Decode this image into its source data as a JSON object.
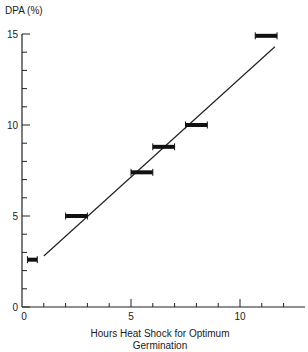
{
  "chart_data": {
    "type": "scatter",
    "title": "",
    "xlabel": "Hours Heat Shock for Optimum Germination",
    "xlabel_line1": "Hours Heat Shock for Optimum",
    "xlabel_line2": "Germination",
    "ylabel": "DPA (%)",
    "xlim": [
      0,
      12.5
    ],
    "ylim": [
      0,
      15
    ],
    "x_ticks": [
      0,
      5,
      10
    ],
    "x_tick_labels": [
      "0",
      "5",
      "10"
    ],
    "x_minor_tick_step": 1,
    "y_ticks": [
      0,
      5,
      10,
      15
    ],
    "y_tick_labels": [
      "0",
      "5",
      "10",
      "15"
    ],
    "y_minor_tick_step": 1,
    "grid": false,
    "legend": null,
    "series": [
      {
        "name": "Observed (horizontal range bars)",
        "marker": "horizontal-bar",
        "points": [
          {
            "x_min": 0.25,
            "x_max": 0.7,
            "y": 2.6
          },
          {
            "x_min": 2.0,
            "x_max": 3.0,
            "y": 5.0
          },
          {
            "x_min": 5.0,
            "x_max": 6.0,
            "y": 7.4
          },
          {
            "x_min": 6.0,
            "x_max": 7.0,
            "y": 8.8
          },
          {
            "x_min": 7.5,
            "x_max": 8.5,
            "y": 10.0
          },
          {
            "x_min": 10.7,
            "x_max": 11.7,
            "y": 14.9
          }
        ]
      },
      {
        "name": "Fitted line",
        "type": "line",
        "x": [
          1.0,
          11.6
        ],
        "y": [
          2.8,
          14.3
        ]
      }
    ]
  }
}
